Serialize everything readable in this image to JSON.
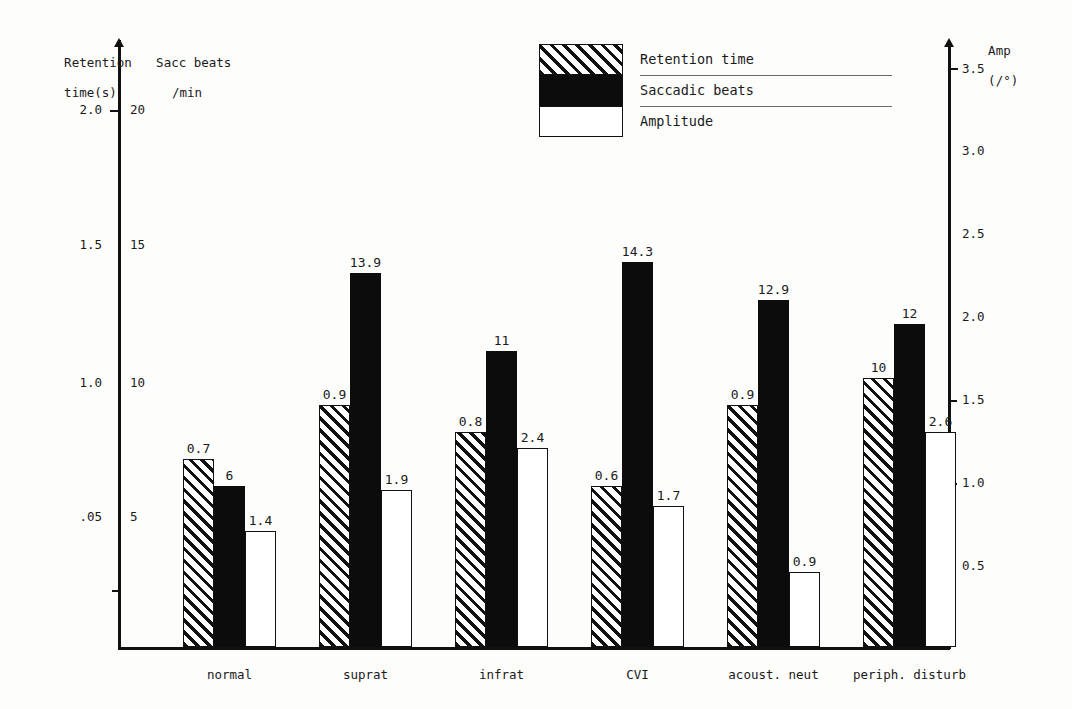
{
  "chart_data": {
    "type": "bar",
    "title": "",
    "categories": [
      "normal",
      "suprat",
      "infrat",
      "CVI",
      "acoust. neut",
      "periph. disturb"
    ],
    "series": [
      {
        "name": "Retention time",
        "key": "retention",
        "unit": "s",
        "axis": "left-retention",
        "values": [
          0.7,
          0.9,
          0.8,
          0.6,
          0.9,
          10
        ],
        "labels": [
          "0.7",
          "0.9",
          "0.8",
          "0.6",
          "0.9",
          "10"
        ]
      },
      {
        "name": "Saccadic beats",
        "key": "saccadic",
        "unit": "/min",
        "axis": "left-sacc",
        "values": [
          6,
          13.9,
          11,
          14.3,
          12.9,
          12
        ],
        "labels": [
          "6",
          "13.9",
          "11",
          "14.3",
          "12.9",
          "12"
        ]
      },
      {
        "name": "Amplitude",
        "key": "amplitude",
        "unit": "/°",
        "axis": "right",
        "values": [
          1.4,
          1.9,
          2.4,
          1.7,
          0.9,
          2.6
        ],
        "labels": [
          "1.4",
          "1.9",
          "2.4",
          "1.7",
          "0.9",
          "2.6"
        ]
      }
    ],
    "axes": {
      "left_primary": {
        "label_line1": "Retention",
        "label_line2": "time(s)",
        "ticks": [
          "2.0",
          "1.5",
          "1.0",
          ".05"
        ],
        "tick_values": [
          2.0,
          1.5,
          1.0,
          0.5
        ],
        "range": [
          0,
          2.2
        ]
      },
      "left_secondary": {
        "label_line1": "Sacc beats",
        "label_line2": "/min",
        "ticks": [
          "20",
          "15",
          "10",
          "5"
        ],
        "tick_values": [
          20,
          15,
          10,
          5
        ],
        "range": [
          0,
          22
        ]
      },
      "right": {
        "label_line1": "Amp",
        "label_line2": "(/°)",
        "ticks": [
          "3.5",
          "3.0",
          "2.5",
          "2.0",
          "1.5",
          "1.0",
          "0.5"
        ],
        "tick_values": [
          3.5,
          3.0,
          2.5,
          2.0,
          1.5,
          1.0,
          0.5
        ],
        "range": [
          0,
          3.75
        ]
      }
    },
    "grid": false,
    "legend_position": "top-center"
  },
  "legend": {
    "items": [
      {
        "label": "Retention time",
        "style": "retention"
      },
      {
        "label": "Saccadic beats",
        "style": "saccadic"
      },
      {
        "label": "Amplitude",
        "style": "amplitude"
      }
    ]
  },
  "colors": {
    "ink": "#111111",
    "fill_black": "#0c0c0c",
    "fill_white": "#ffffff",
    "background": "#fdfdfc"
  }
}
